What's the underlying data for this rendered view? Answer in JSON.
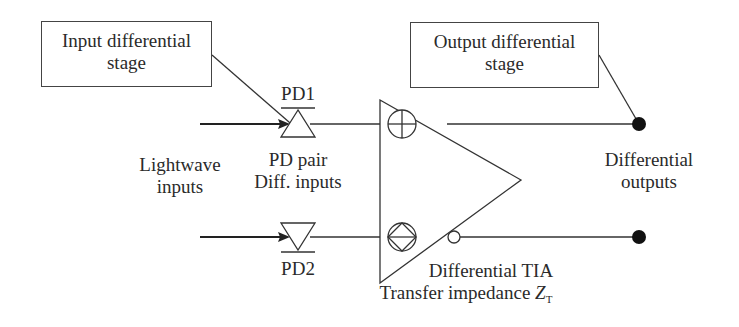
{
  "diagram": {
    "callouts": {
      "input_stage": {
        "line1": "Input differential",
        "line2": "stage"
      },
      "output_stage": {
        "line1": "Output differential",
        "line2": "stage"
      }
    },
    "photodiodes": {
      "pd1": "PD1",
      "pd2": "PD2",
      "pair_label_line1": "PD pair",
      "pair_label_line2": "Diff. inputs"
    },
    "inputs_label": {
      "line1": "Lightwave",
      "line2": "inputs"
    },
    "outputs_label": {
      "line1": "Differential",
      "line2": "outputs"
    },
    "amplifier": {
      "line1": "Differential TIA",
      "line2_prefix": "Transfer impedance ",
      "symbol": "Z",
      "subscript": "T",
      "plus_input": "non-inverting",
      "minus_input": "inverting"
    },
    "colors": {
      "line": "#333333",
      "dot": "#111111"
    }
  }
}
